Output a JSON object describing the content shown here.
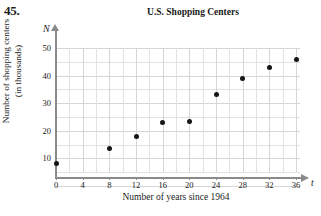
{
  "problem_number": "45.",
  "chart_data": {
    "type": "scatter",
    "title": "U.S. Shopping Centers",
    "xlabel": "Number of years since 1964",
    "ylabel_lines": [
      "Number of shopping centers",
      "(in thousands)"
    ],
    "x_axis_symbol": "t",
    "y_axis_symbol": "N",
    "xlim": [
      0,
      37
    ],
    "ylim": [
      0,
      55
    ],
    "xticks": [
      0,
      4,
      8,
      12,
      16,
      20,
      24,
      28,
      32,
      36
    ],
    "xtick_labels": [
      "0",
      "4",
      "8",
      "12",
      "16",
      "20",
      "24",
      "28",
      "32",
      "36"
    ],
    "yticks": [
      10,
      20,
      30,
      40,
      50
    ],
    "ytick_labels": [
      "10",
      "20",
      "30",
      "40",
      "50"
    ],
    "grid": true,
    "grid_color": "#e2e2e4",
    "marker_color": "#161616",
    "axis_color": "#8a8a8a",
    "legend": null,
    "x": [
      0,
      8,
      12,
      16,
      20,
      24,
      28,
      32,
      36
    ],
    "values": [
      8,
      13.5,
      18,
      23,
      23.5,
      33,
      39,
      43,
      46
    ],
    "points": [
      {
        "t": 0,
        "n": 8
      },
      {
        "t": 8,
        "n": 13.5
      },
      {
        "t": 12,
        "n": 18
      },
      {
        "t": 16,
        "n": 23
      },
      {
        "t": 20,
        "n": 23.5
      },
      {
        "t": 24,
        "n": 33
      },
      {
        "t": 28,
        "n": 39
      },
      {
        "t": 32,
        "n": 43
      },
      {
        "t": 36,
        "n": 46
      }
    ]
  }
}
